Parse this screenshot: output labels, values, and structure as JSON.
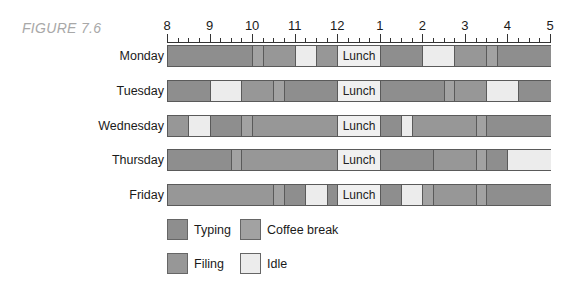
{
  "figure_label": "FIGURE 7.6",
  "colors": {
    "typing": "#8e8e8e",
    "coffee": "#a2a2a2",
    "filing": "#979797",
    "idle": "#ececec",
    "lunch": "#f0f0f0",
    "border": "#5a5a5a"
  },
  "axis": {
    "tick_labels": [
      "8",
      "9",
      "10",
      "11",
      "12",
      "1",
      "2",
      "3",
      "4",
      "5"
    ],
    "minor_ticks_per_hour": 4
  },
  "legend": [
    {
      "key": "typing",
      "label": "Typing"
    },
    {
      "key": "coffee",
      "label": "Coffee break"
    },
    {
      "key": "filing",
      "label": "Filing"
    },
    {
      "key": "idle",
      "label": "Idle"
    }
  ],
  "lunch_label": "Lunch",
  "chart_data": {
    "type": "gantt",
    "title": "FIGURE 7.6",
    "xlabel": "Time of day (hours)",
    "ylabel": "",
    "x_range": [
      8,
      17
    ],
    "x_tick_labels": [
      "8",
      "9",
      "10",
      "11",
      "12",
      "1",
      "2",
      "3",
      "4",
      "5"
    ],
    "categories": [
      "Monday",
      "Tuesday",
      "Wednesday",
      "Thursday",
      "Friday"
    ],
    "legend": [
      "Typing",
      "Coffee break",
      "Filing",
      "Idle"
    ],
    "rows": [
      {
        "day": "Monday",
        "segments": [
          {
            "start": 8,
            "end": 10,
            "activity": "Typing"
          },
          {
            "start": 10,
            "end": 10.25,
            "activity": "Coffee break"
          },
          {
            "start": 10.25,
            "end": 11,
            "activity": "Filing"
          },
          {
            "start": 11,
            "end": 11.5,
            "activity": "Idle"
          },
          {
            "start": 11.5,
            "end": 12,
            "activity": "Filing"
          },
          {
            "start": 12,
            "end": 13,
            "activity": "Lunch"
          },
          {
            "start": 13,
            "end": 14,
            "activity": "Typing"
          },
          {
            "start": 14,
            "end": 14.75,
            "activity": "Idle"
          },
          {
            "start": 14.75,
            "end": 15.5,
            "activity": "Filing"
          },
          {
            "start": 15.5,
            "end": 15.75,
            "activity": "Coffee break"
          },
          {
            "start": 15.75,
            "end": 17,
            "activity": "Typing"
          }
        ]
      },
      {
        "day": "Tuesday",
        "segments": [
          {
            "start": 8,
            "end": 9,
            "activity": "Typing"
          },
          {
            "start": 9,
            "end": 9.75,
            "activity": "Idle"
          },
          {
            "start": 9.75,
            "end": 10.5,
            "activity": "Filing"
          },
          {
            "start": 10.5,
            "end": 10.75,
            "activity": "Coffee break"
          },
          {
            "start": 10.75,
            "end": 12,
            "activity": "Typing"
          },
          {
            "start": 12,
            "end": 13,
            "activity": "Lunch"
          },
          {
            "start": 13,
            "end": 14.5,
            "activity": "Typing"
          },
          {
            "start": 14.5,
            "end": 14.75,
            "activity": "Coffee break"
          },
          {
            "start": 14.75,
            "end": 15.5,
            "activity": "Filing"
          },
          {
            "start": 15.5,
            "end": 16.25,
            "activity": "Idle"
          },
          {
            "start": 16.25,
            "end": 17,
            "activity": "Typing"
          }
        ]
      },
      {
        "day": "Wednesday",
        "segments": [
          {
            "start": 8,
            "end": 8.5,
            "activity": "Filing"
          },
          {
            "start": 8.5,
            "end": 9,
            "activity": "Idle"
          },
          {
            "start": 9,
            "end": 9.75,
            "activity": "Typing"
          },
          {
            "start": 9.75,
            "end": 10,
            "activity": "Coffee break"
          },
          {
            "start": 10,
            "end": 12,
            "activity": "Filing"
          },
          {
            "start": 12,
            "end": 13,
            "activity": "Lunch"
          },
          {
            "start": 13,
            "end": 13.5,
            "activity": "Typing"
          },
          {
            "start": 13.5,
            "end": 13.75,
            "activity": "Idle"
          },
          {
            "start": 13.75,
            "end": 15.25,
            "activity": "Filing"
          },
          {
            "start": 15.25,
            "end": 15.5,
            "activity": "Coffee break"
          },
          {
            "start": 15.5,
            "end": 17,
            "activity": "Typing"
          }
        ]
      },
      {
        "day": "Thursday",
        "segments": [
          {
            "start": 8,
            "end": 9.5,
            "activity": "Typing"
          },
          {
            "start": 9.5,
            "end": 9.75,
            "activity": "Coffee break"
          },
          {
            "start": 9.75,
            "end": 12,
            "activity": "Filing"
          },
          {
            "start": 12,
            "end": 13,
            "activity": "Lunch"
          },
          {
            "start": 13,
            "end": 14.25,
            "activity": "Typing"
          },
          {
            "start": 14.25,
            "end": 15.25,
            "activity": "Filing"
          },
          {
            "start": 15.25,
            "end": 15.5,
            "activity": "Coffee break"
          },
          {
            "start": 15.5,
            "end": 16,
            "activity": "Typing"
          },
          {
            "start": 16,
            "end": 17,
            "activity": "Idle"
          }
        ]
      },
      {
        "day": "Friday",
        "segments": [
          {
            "start": 8,
            "end": 10.5,
            "activity": "Filing"
          },
          {
            "start": 10.5,
            "end": 10.75,
            "activity": "Coffee break"
          },
          {
            "start": 10.75,
            "end": 11.25,
            "activity": "Typing"
          },
          {
            "start": 11.25,
            "end": 11.75,
            "activity": "Idle"
          },
          {
            "start": 11.75,
            "end": 12,
            "activity": "Typing"
          },
          {
            "start": 12,
            "end": 13,
            "activity": "Lunch"
          },
          {
            "start": 13,
            "end": 13.5,
            "activity": "Typing"
          },
          {
            "start": 13.5,
            "end": 14,
            "activity": "Idle"
          },
          {
            "start": 14,
            "end": 14.25,
            "activity": "Coffee break"
          },
          {
            "start": 14.25,
            "end": 15.25,
            "activity": "Filing"
          },
          {
            "start": 15.25,
            "end": 15.5,
            "activity": "Coffee break"
          },
          {
            "start": 15.5,
            "end": 17,
            "activity": "Typing"
          }
        ]
      }
    ]
  }
}
